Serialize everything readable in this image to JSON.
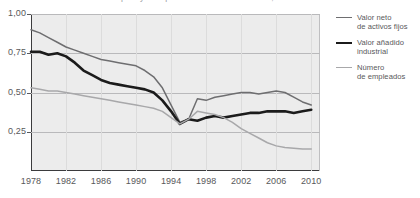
{
  "chart_data": {
    "type": "line",
    "title": "Empleo y el capital del total de la industria, 1978-2010",
    "xlabel": "",
    "ylabel": "",
    "xlim": [
      1978,
      2011
    ],
    "ylim": [
      0,
      1.0
    ],
    "grid": true,
    "legend_position": "right",
    "yticks": [
      "1,00",
      "0,75",
      "0,50",
      "0,25"
    ],
    "ytick_values": [
      1.0,
      0.75,
      0.5,
      0.25
    ],
    "xticks": [
      "1978",
      "1982",
      "1986",
      "1990",
      "1994",
      "1998",
      "2002",
      "2006",
      "2010"
    ],
    "xtick_values": [
      1978,
      1982,
      1986,
      1990,
      1994,
      1998,
      2002,
      2006,
      2010
    ],
    "x": [
      1978,
      1979,
      1980,
      1981,
      1982,
      1983,
      1984,
      1985,
      1986,
      1987,
      1988,
      1989,
      1990,
      1991,
      1992,
      1993,
      1994,
      1995,
      1996,
      1997,
      1998,
      1999,
      2000,
      2001,
      2002,
      2003,
      2004,
      2005,
      2006,
      2007,
      2008,
      2009,
      2010
    ],
    "series": [
      {
        "name": "Valor neto de activos fijos",
        "color": "#6e6e70",
        "width": 1.5,
        "values": [
          0.9,
          0.88,
          0.85,
          0.82,
          0.79,
          0.77,
          0.75,
          0.73,
          0.71,
          0.7,
          0.69,
          0.68,
          0.67,
          0.64,
          0.6,
          0.53,
          0.42,
          0.31,
          0.33,
          0.46,
          0.45,
          0.47,
          0.48,
          0.49,
          0.5,
          0.5,
          0.49,
          0.5,
          0.51,
          0.5,
          0.47,
          0.44,
          0.42
        ]
      },
      {
        "name": "Valor añadido industrial",
        "color": "#1b1b1b",
        "width": 2.6,
        "values": [
          0.76,
          0.76,
          0.74,
          0.75,
          0.73,
          0.69,
          0.64,
          0.61,
          0.58,
          0.56,
          0.55,
          0.54,
          0.53,
          0.52,
          0.5,
          0.45,
          0.38,
          0.3,
          0.33,
          0.32,
          0.34,
          0.35,
          0.34,
          0.35,
          0.36,
          0.37,
          0.37,
          0.38,
          0.38,
          0.38,
          0.37,
          0.38,
          0.39
        ]
      },
      {
        "name": "Número de empleados",
        "color": "#a8a8aa",
        "width": 1.5,
        "values": [
          0.53,
          0.52,
          0.51,
          0.51,
          0.5,
          0.49,
          0.48,
          0.47,
          0.46,
          0.45,
          0.44,
          0.43,
          0.42,
          0.41,
          0.4,
          0.38,
          0.34,
          0.3,
          0.33,
          0.38,
          0.37,
          0.36,
          0.34,
          0.31,
          0.27,
          0.24,
          0.21,
          0.18,
          0.16,
          0.15,
          0.145,
          0.14,
          0.14
        ]
      }
    ]
  },
  "legend": {
    "items": [
      {
        "line1": "Valor neto",
        "line2": "de activos fijos"
      },
      {
        "line1": "Valor añadido",
        "line2": "industrial"
      },
      {
        "line1": "Número",
        "line2": "de empleados"
      }
    ]
  }
}
